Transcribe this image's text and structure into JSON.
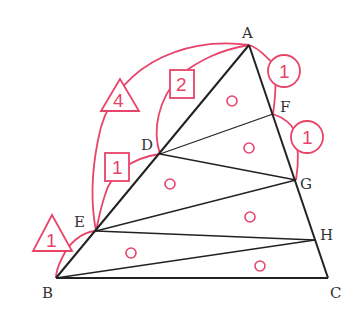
{
  "diagram": {
    "type": "geometry-triangle-area-ratio",
    "colors": {
      "line": "#222222",
      "annotation": "#e8446a",
      "label": "#333333"
    },
    "points": {
      "A": {
        "label": "A",
        "x": 249,
        "y": 45
      },
      "B": {
        "label": "B",
        "x": 56,
        "y": 278
      },
      "C": {
        "label": "C",
        "x": 328,
        "y": 278
      },
      "D": {
        "label": "D",
        "x": 160,
        "y": 154
      },
      "E": {
        "label": "E",
        "x": 96,
        "y": 231
      },
      "F": {
        "label": "F",
        "x": 273,
        "y": 114
      },
      "G": {
        "label": "G",
        "x": 296,
        "y": 180
      },
      "H": {
        "label": "H",
        "x": 315,
        "y": 240
      }
    },
    "segments": [
      "AB",
      "BC",
      "CA",
      "DF",
      "DG",
      "EG",
      "EH",
      "BH"
    ],
    "ratio_marks": [
      {
        "shape": "triangle",
        "value": "4",
        "spans": "A-E"
      },
      {
        "shape": "square",
        "value": "2",
        "spans": "A-D"
      },
      {
        "shape": "square",
        "value": "1",
        "spans": "D-E"
      },
      {
        "shape": "triangle",
        "value": "1",
        "spans": "E-B"
      },
      {
        "shape": "circle",
        "value": "1",
        "spans": "A-F"
      },
      {
        "shape": "circle",
        "value": "1",
        "spans": "F-G"
      }
    ],
    "equal_area_marks": {
      "symbol": "o",
      "count": 6
    }
  }
}
